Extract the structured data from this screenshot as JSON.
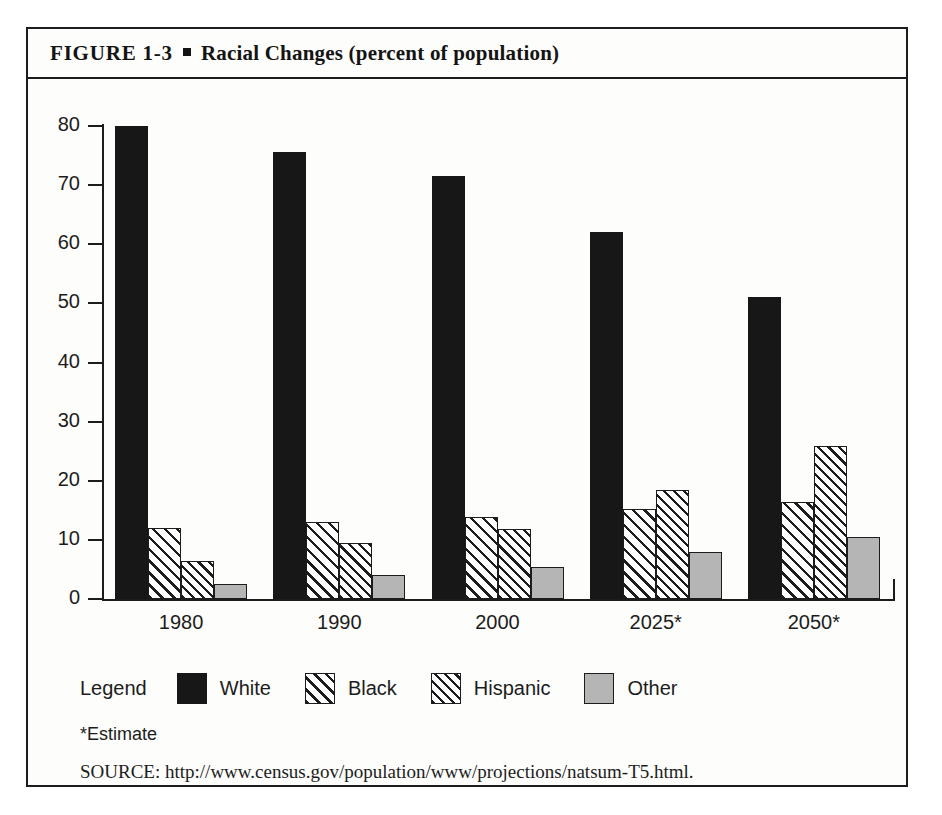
{
  "figure": {
    "label": "FIGURE  1-3",
    "bullet": "square-bullet",
    "title": "Racial Changes (percent of population)"
  },
  "footnote": "*Estimate",
  "source": "SOURCE: http://www.census.gov/population/www/projections/natsum-T5.html.",
  "legend": {
    "title": "Legend",
    "entries": [
      {
        "label": "White",
        "pattern": "solid-black",
        "color": "#171717"
      },
      {
        "label": "Black",
        "pattern": "diagonal-hatch",
        "color": "#ffffff"
      },
      {
        "label": "Hispanic",
        "pattern": "cross-hatch",
        "color": "#ffffff"
      },
      {
        "label": "Other",
        "pattern": "solid-gray",
        "color": "#b5b5b5"
      }
    ]
  },
  "chart_data": {
    "type": "bar",
    "title": "Racial Changes (percent of population)",
    "xlabel": "",
    "ylabel": "",
    "ylim": [
      0,
      80
    ],
    "yticks": [
      0,
      10,
      20,
      30,
      40,
      50,
      60,
      70,
      80
    ],
    "ytick_labels": [
      "0",
      "10",
      "20",
      "30",
      "40",
      "50",
      "60",
      "70",
      "80"
    ],
    "grid": false,
    "legend_position": "below-plot",
    "categories": [
      "1980",
      "1990",
      "2000",
      "2025*",
      "2050*"
    ],
    "series": [
      {
        "name": "White",
        "values": [
          80.0,
          75.6,
          71.6,
          62.0,
          51.0
        ]
      },
      {
        "name": "Black",
        "values": [
          12.0,
          13.0,
          13.8,
          15.2,
          16.4
        ]
      },
      {
        "name": "Hispanic",
        "values": [
          6.5,
          9.5,
          11.8,
          18.4,
          25.8
        ]
      },
      {
        "name": "Other",
        "values": [
          2.5,
          4.0,
          5.4,
          8.0,
          10.5
        ]
      }
    ],
    "annotations": [
      "*Estimate"
    ]
  }
}
